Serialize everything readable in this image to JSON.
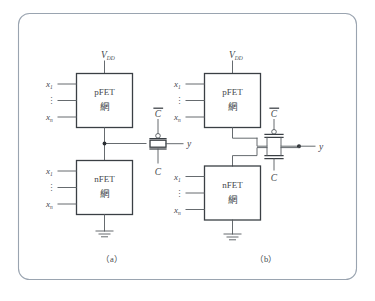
{
  "figure": {
    "type": "circuit-diagram",
    "border_color": "#9aa4b0",
    "wire_color": "#555a5f",
    "box_color": "#3a3f44",
    "background": "#ffffff",
    "captions": {
      "left": "（a）",
      "right": "（b）"
    }
  },
  "labels": {
    "vdd": "V",
    "vdd_sub": "DD",
    "pfet_line1": "pFET",
    "pfet_line2": "網",
    "nfet_line1": "nFET",
    "nfet_line2": "網",
    "input_first": "x",
    "input_first_sub": "1",
    "input_last": "x",
    "input_last_sub": "n",
    "vertical_dots": "⋮",
    "clock_bar": "C",
    "clock": "C",
    "output": "y",
    "ground": "gnd-symbol"
  },
  "panel_a": {
    "name": "dynamic-logic-with-transmission-gate",
    "pfet_block_label": "pFET 網",
    "nfet_block_label": "nFET 網",
    "gate_symbol": "transmission-gate",
    "gate_top_control": "C",
    "gate_bottom_control": "C",
    "output_label": "y",
    "supply_label": "VDD",
    "inputs": [
      "x1",
      "⋮",
      "xn"
    ]
  },
  "panel_b": {
    "name": "dynamic-logic-with-discrete-pass-transistors",
    "pfet_block_label": "pFET 網",
    "nfet_block_label": "nFET 網",
    "pmos_control": "C",
    "nmos_control": "C",
    "output_label": "y",
    "supply_label": "VDD",
    "inputs": [
      "x1",
      "⋮",
      "xn"
    ]
  }
}
